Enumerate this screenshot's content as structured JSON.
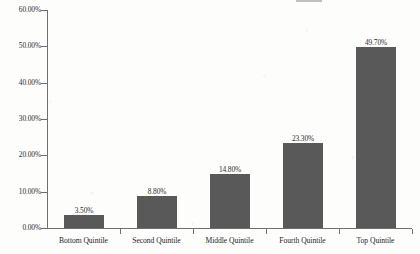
{
  "chart_data": {
    "type": "bar",
    "title": "",
    "xlabel": "",
    "ylabel": "",
    "categories": [
      "Bottom Quintile",
      "Second Quintile",
      "Middle Quintile",
      "Fourth Quintile",
      "Top Quintile"
    ],
    "values": [
      3.5,
      8.8,
      14.8,
      23.3,
      49.7
    ],
    "value_labels": [
      "3.50%",
      "8.80%",
      "14.80%",
      "23.30%",
      "49.70%"
    ],
    "ylim": [
      0,
      60
    ],
    "ytick_values": [
      0,
      10,
      20,
      30,
      40,
      50,
      60
    ],
    "ytick_labels": [
      "0.00%",
      "10.00%",
      "20.00%",
      "30.00%",
      "40.00%",
      "50.00%",
      "60.00%"
    ],
    "grid": false,
    "legend": null,
    "bar_color": "#595959",
    "axis_color": "#6f6f6f",
    "text_color": "#2b2b2b"
  }
}
